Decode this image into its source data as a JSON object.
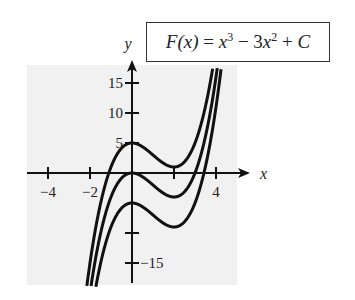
{
  "chart_data": {
    "type": "line",
    "xlabel": "x",
    "ylabel": "y",
    "xlim": [
      -5,
      5.5
    ],
    "ylim": [
      -19,
      17.5
    ],
    "x_ticks": [
      -4,
      -2,
      2,
      4
    ],
    "x_tick_labels": [
      "-4",
      "-2",
      "",
      "4"
    ],
    "y_ticks": [
      15,
      10,
      5,
      -10,
      -15
    ],
    "y_tick_labels": [
      "15",
      "10",
      "5",
      "",
      "-15"
    ],
    "grid": false,
    "background": "#f1f1f1",
    "series": [
      {
        "name": "C = 5",
        "C": 5
      },
      {
        "name": "C = 0",
        "C": 0
      },
      {
        "name": "C = -5",
        "C": -5
      }
    ],
    "formula": {
      "lhs": "F(x)",
      "eq": "=",
      "term1_base": "x",
      "term1_exp": "3",
      "minus": "−",
      "term2_coef": "3",
      "term2_base": "x",
      "term2_exp": "2",
      "plus": "+",
      "const": "C"
    }
  },
  "layout": {
    "origin_px": [
      132,
      173
    ],
    "x_scale": 21,
    "y_scale": 6,
    "plot_bg": {
      "x": 27,
      "y": 65,
      "w": 210,
      "h": 220
    },
    "curve_clip_top": 68,
    "curve_clip_bottom": 287,
    "x_axis": {
      "from": 27,
      "to": 250
    },
    "y_axis": {
      "from": 283,
      "to": 60
    }
  }
}
